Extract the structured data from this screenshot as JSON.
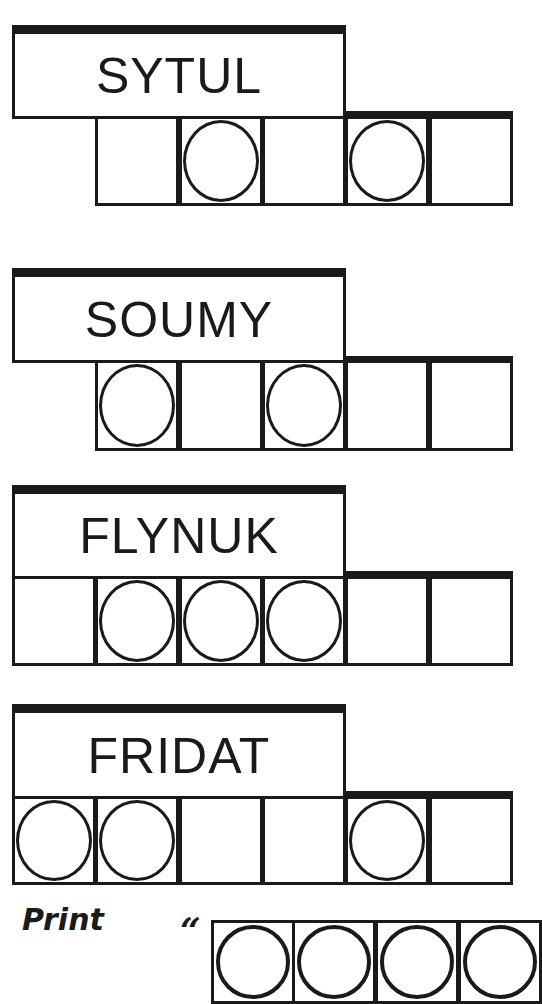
{
  "puzzle": {
    "colors": {
      "ink": "#1a1a1a",
      "paper": "#ffffff"
    },
    "words": [
      {
        "scrambled": "SYTUL",
        "letters": 5,
        "circled": [
          false,
          true,
          false,
          true,
          false
        ]
      },
      {
        "scrambled": "SOUMY",
        "letters": 5,
        "circled": [
          true,
          false,
          true,
          false,
          false
        ]
      },
      {
        "scrambled": "FLYNUK",
        "letters": 6,
        "circled": [
          false,
          true,
          true,
          true,
          false,
          false
        ]
      },
      {
        "scrambled": "FRIDAT",
        "letters": 6,
        "circled": [
          true,
          true,
          false,
          false,
          true,
          false
        ]
      }
    ],
    "answer": {
      "label": "Print",
      "open_quote": "“",
      "visible_cells": 4,
      "circled": [
        true,
        true,
        true,
        true
      ]
    }
  }
}
